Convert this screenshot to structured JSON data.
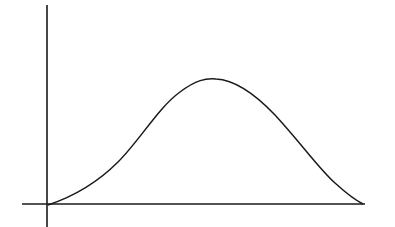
{
  "diagram": {
    "type": "curve-on-axes",
    "colors": {
      "background": "#ffffff",
      "stroke": "#1a1a1a"
    },
    "axes": {
      "x": {
        "x1": 22,
        "y1": 204,
        "x2": 365,
        "y2": 204
      },
      "y": {
        "x1": 47,
        "y1": 5,
        "x2": 47,
        "y2": 227
      }
    },
    "curve": {
      "path": "M48,205 C75,196 98,182 118,162 C140,140 158,108 180,92 C196,80 206,78 216,79 C236,80 255,94 275,115 C300,142 320,170 335,183 C346,193 355,200 363,204",
      "peak": {
        "x": 214,
        "y": 79
      },
      "start": {
        "x": 48,
        "y": 205
      },
      "end": {
        "x": 363,
        "y": 204
      }
    }
  }
}
